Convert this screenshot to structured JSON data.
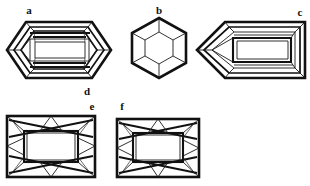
{
  "page": {
    "background_color": "#ffffff",
    "ink_color": "#111111",
    "width": 310,
    "height": 186
  },
  "figures": [
    {
      "id": "a",
      "label": "a",
      "label_x": 29,
      "label_y": 14,
      "shape": "elongated-hexagon",
      "name": "elongated hexagonal step cut, face-up view",
      "center_x": 59,
      "center_y": 50,
      "half_width": 52,
      "half_height": 29
    },
    {
      "id": "b",
      "label": "b",
      "label_x": 159,
      "label_y": 14,
      "shape": "regular-hexagon",
      "name": "regular hexagonal cut with concentric hexagon table",
      "center_x": 159,
      "center_y": 48,
      "radius": 31
    },
    {
      "id": "c",
      "label": "c",
      "label_x": 300,
      "label_y": 16,
      "shape": "pentagon-shield",
      "name": "shield or bullet cut, pointed left end with rectangular table",
      "center_x": 251,
      "center_y": 50,
      "half_width": 54,
      "half_height": 28
    },
    {
      "id": "d",
      "label": "d",
      "label_x": 87,
      "label_y": 95,
      "shape": "label-only",
      "name": "caption d beneath figure a"
    },
    {
      "id": "e",
      "label": "e",
      "label_x": 92,
      "label_y": 110,
      "shape": "rectangle-brilliant",
      "name": "rectangular emerald cut with crossed corner facets",
      "center_x": 51,
      "center_y": 146,
      "half_width": 44,
      "half_height": 31
    },
    {
      "id": "f",
      "label": "f",
      "label_x": 122,
      "label_y": 110,
      "shape": "rectangle-brilliant",
      "name": "rectangular emerald cut with crossed corner facets, narrower",
      "center_x": 158,
      "center_y": 148,
      "half_width": 42,
      "half_height": 30
    }
  ],
  "labels": {
    "a": "a",
    "b": "b",
    "c": "c",
    "d": "d",
    "e": "e",
    "f": "f"
  }
}
